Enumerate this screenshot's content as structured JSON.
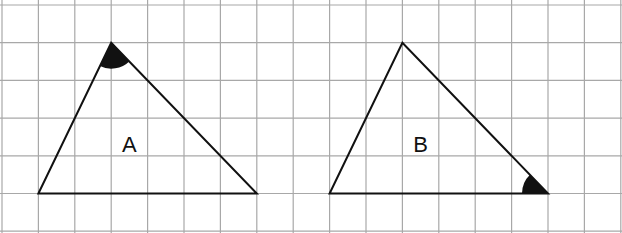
{
  "diagram": {
    "type": "grid-triangles",
    "grid": {
      "columns": 17,
      "rows": 6,
      "origin_x": 2,
      "origin_y": 5,
      "cell_w": 36.4,
      "cell_h": 37.7,
      "line_color": "#a8a8a8",
      "background": "#ffffff"
    },
    "stroke_color": "#111111",
    "fill_marker_color": "#111111",
    "triangles": [
      {
        "label": "A",
        "vertices_grid": [
          [
            1,
            5
          ],
          [
            3,
            1
          ],
          [
            7,
            5
          ]
        ],
        "marked_angle_vertex": 1,
        "label_pos_grid": [
          3.3,
          3.7
        ]
      },
      {
        "label": "B",
        "vertices_grid": [
          [
            9,
            5
          ],
          [
            11,
            1
          ],
          [
            15,
            5
          ]
        ],
        "marked_angle_vertex": 2,
        "label_pos_grid": [
          11.3,
          3.7
        ]
      }
    ]
  }
}
